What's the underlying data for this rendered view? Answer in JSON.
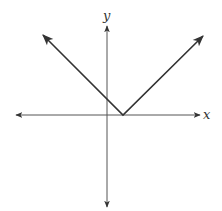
{
  "chart_data": {
    "type": "line",
    "title": "",
    "xlabel": "x",
    "ylabel": "y",
    "grid": false,
    "legend": null,
    "axes": {
      "origin_px": [
        107,
        115
      ],
      "x_axis": {
        "from_px": 16,
        "to_px": 200,
        "arrows": "both"
      },
      "y_axis": {
        "from_px": 26,
        "to_px": 207,
        "arrows": "both"
      }
    },
    "series": [
      {
        "name": "y = |x - a|",
        "shape": "V",
        "vertex_px": [
          123,
          115
        ],
        "left_tip_px": [
          43,
          35
        ],
        "right_tip_px": [
          203,
          36
        ],
        "y_intercept_px": [
          107,
          98
        ],
        "slopes": [
          -1,
          1
        ],
        "arrows": "both"
      }
    ],
    "colors": {
      "axes": "#444444",
      "curve": "#333333"
    }
  },
  "labels": {
    "x": "x",
    "y": "y"
  }
}
